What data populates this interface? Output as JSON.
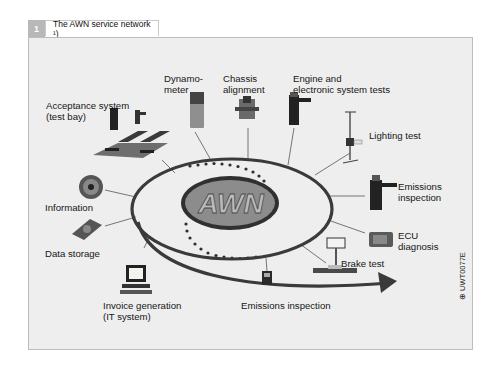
{
  "figure": {
    "number": "1",
    "title": "The AWN service network ¹)",
    "center_logo": "AWN",
    "code": "⊕ UWT0077E"
  },
  "nodes": [
    {
      "id": "acceptance",
      "label": "Acceptance system\n(test bay)"
    },
    {
      "id": "dynamometer",
      "label": "Dynamo-\nmeter"
    },
    {
      "id": "chassis",
      "label": "Chassis\nalignment"
    },
    {
      "id": "engine",
      "label": "Engine and\nelectronic system tests"
    },
    {
      "id": "lighting",
      "label": "Lighting test"
    },
    {
      "id": "emissions_right",
      "label": "Emissions\ninspection"
    },
    {
      "id": "ecu",
      "label": "ECU\ndiagnosis"
    },
    {
      "id": "brake",
      "label": "Brake test"
    },
    {
      "id": "emissions_bottom",
      "label": "Emissions inspection"
    },
    {
      "id": "invoice",
      "label": "Invoice generation\n(IT system)"
    },
    {
      "id": "data_storage",
      "label": "Data storage"
    },
    {
      "id": "information",
      "label": "Information"
    }
  ],
  "colors": {
    "frame_bg": "#eeeeee",
    "ring": "#3a3a3a",
    "logo_fill": "#8a8a8a",
    "header_num_bg": "#b8b8b8"
  }
}
